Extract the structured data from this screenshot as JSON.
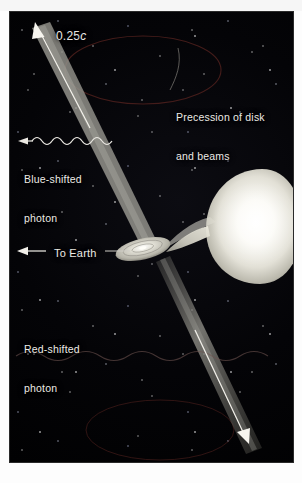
{
  "figure": {
    "kind": "astronomy-diagram",
    "background_color": "#000000",
    "ghost_text": "",
    "labels": {
      "jet_speed": "0.25c",
      "jet_speed_value": "0.25",
      "jet_speed_unit": "c",
      "precession": "Precession of disk\nand beams",
      "precession_line1": "Precession of disk",
      "precession_line2": "and beams",
      "blue_shifted": "Blue-shifted\nphoton",
      "blue_shifted_line1": "Blue-shifted",
      "blue_shifted_line2": "photon",
      "to_earth": "To Earth",
      "red_shifted": "Red-shifted\nphoton",
      "red_shifted_line1": "Red-shifted",
      "red_shifted_line2": "photon"
    },
    "objects": {
      "companion_star": "companion-star",
      "accretion_disk": "accretion-disk",
      "gas_stream": "gas-stream",
      "upper_jet": "upper-jet-beam",
      "lower_jet": "lower-jet-beam",
      "precession_ellipse_top": "precession-cone-ellipse-top",
      "precession_ellipse_bottom": "precession-cone-ellipse-bottom",
      "blue_photon_wave": "blue-shifted-photon-wave",
      "red_photon_wave": "red-shifted-photon-wave"
    },
    "colors": {
      "star": "#f7f6f1",
      "jet": "#8d8c86",
      "disk": "#cfcec7",
      "label_text": "#eceae6",
      "precession_ellipse": "#5a2420"
    }
  }
}
